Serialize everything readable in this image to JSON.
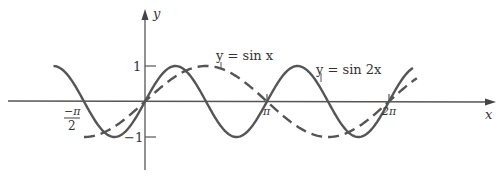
{
  "chart_data": {
    "type": "line",
    "title": "",
    "xlabel": "x",
    "ylabel": "y",
    "xlim": [
      -2.36,
      2.36
    ],
    "ylim": [
      -1.5,
      1.6
    ],
    "grid": false,
    "x_ticks": [
      {
        "value": -1.5708,
        "label": "-π/2",
        "num": "−π",
        "den": "2"
      },
      {
        "value": 3.1416,
        "label": "π"
      },
      {
        "value": 6.2832,
        "label": "2π"
      }
    ],
    "y_ticks": [
      {
        "value": 1,
        "label": "1"
      },
      {
        "value": -1,
        "label": "−1"
      }
    ],
    "series": [
      {
        "name": "y = sin x",
        "style": "dashed",
        "function": "sin(x)",
        "x_range": [
          -1.5708,
          7.0
        ]
      },
      {
        "name": "y = sin 2x",
        "style": "solid",
        "function": "sin(2x)",
        "x_range": [
          -2.356,
          6.9
        ]
      }
    ],
    "annotations": [
      {
        "text": "y = sin x",
        "target_series": "y = sin x"
      },
      {
        "text": "y = sin 2x",
        "target_series": "y = sin 2x"
      }
    ],
    "color": "#555555"
  },
  "labels": {
    "x_axis": "x",
    "y_axis": "y",
    "y_one": "1",
    "y_minus_one": "−1",
    "neg_half_pi_num": "−π",
    "neg_half_pi_den": "2",
    "pi": "π",
    "two_pi": "2π",
    "sinx_label": "y = sin x",
    "sin2x_label": "y = sin 2x"
  }
}
